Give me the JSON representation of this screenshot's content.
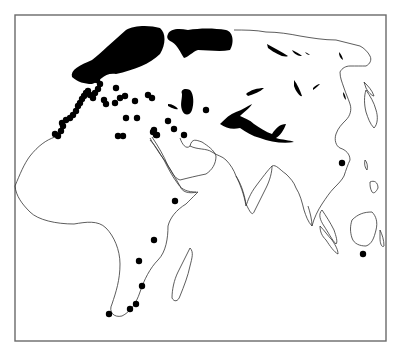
{
  "map": {
    "type": "distribution-map",
    "extent": "Africa, Europe and Asia",
    "colors": {
      "background": "#ffffff",
      "frame": "#6a6a6a",
      "coastline": "#333333",
      "range_fill": "#000000",
      "record_dot": "#000000"
    },
    "frame": {
      "x": 15,
      "y": 15,
      "width": 371,
      "height": 326
    },
    "dot_radius": 3.2,
    "range_regions": [
      {
        "name": "northern-europe-scandinavia",
        "path": "M72,77 C70,70 80,65 92,60 C102,52 112,42 126,30 C134,25 150,25 160,28 C166,33 166,44 160,54 C150,64 134,70 116,74 C104,72 100,82 92,84 C84,84 78,82 72,77 Z"
      },
      {
        "name": "northern-russia",
        "path": "M168,34 C170,29 178,28 188,30 C200,28 214,28 226,30 C234,32 234,44 230,50 C220,52 208,50 198,50 C192,52 190,56 184,58 C180,52 178,46 172,42 C168,40 166,38 168,34 Z"
      },
      {
        "name": "caspian-region",
        "path": "M182,94 C180,89 186,88 190,90 C194,94 194,104 192,110 C190,116 184,116 182,110 C180,104 182,100 182,94 Z"
      },
      {
        "name": "caucasus-streak",
        "path": "M168,104 C172,104 176,106 178,109 C176,110 172,108 168,106 Z"
      },
      {
        "name": "central-asia-tibet",
        "path": "M220,124 C226,118 230,114 236,112 C242,110 248,106 252,104 C250,108 244,112 240,116 C244,118 250,120 254,124 C260,128 266,132 272,134 C276,128 280,124 286,124 C284,130 280,136 276,138 C282,140 290,140 294,142 C284,144 270,142 260,138 C252,136 246,132 240,128 C232,130 226,128 220,124 Z"
      },
      {
        "name": "mongolia-patch",
        "path": "M246,94 C250,90 258,88 264,88 C260,92 254,94 248,96 Z"
      },
      {
        "name": "siberia-1",
        "path": "M267,44 C274,48 282,52 288,56 C284,58 276,54 268,48 Z"
      },
      {
        "name": "siberia-2",
        "path": "M292,50 C296,52 300,54 302,56 C298,56 294,54 292,50 Z"
      },
      {
        "name": "siberia-3",
        "path": "M305,52 C307,53 309,54 310,55 C308,55 306,54 305,52 Z"
      },
      {
        "name": "amur",
        "path": "M294,80 C297,84 300,90 302,96 C300,97 296,92 294,86 Z"
      },
      {
        "name": "far-east-1",
        "path": "M313,88 C315,86 318,84 320,84 C318,86 316,88 313,90 Z"
      },
      {
        "name": "kamchatka-patch",
        "path": "M339,52 C341,54 343,58 343,60 C340,58 339,56 339,52 Z"
      },
      {
        "name": "sakhalin-patch",
        "path": "M343,92 C345,94 346,98 346,100 C344,98 343,96 343,92 Z"
      }
    ],
    "record_dots": [
      {
        "x": 55,
        "y": 134
      },
      {
        "x": 58,
        "y": 136
      },
      {
        "x": 61,
        "y": 131
      },
      {
        "x": 63,
        "y": 126
      },
      {
        "x": 62,
        "y": 123
      },
      {
        "x": 66,
        "y": 120
      },
      {
        "x": 70,
        "y": 118
      },
      {
        "x": 73,
        "y": 115
      },
      {
        "x": 76,
        "y": 111
      },
      {
        "x": 78,
        "y": 106
      },
      {
        "x": 80,
        "y": 103
      },
      {
        "x": 82,
        "y": 99
      },
      {
        "x": 84,
        "y": 96
      },
      {
        "x": 86,
        "y": 93
      },
      {
        "x": 88,
        "y": 91
      },
      {
        "x": 90,
        "y": 95
      },
      {
        "x": 93,
        "y": 98
      },
      {
        "x": 95,
        "y": 93
      },
      {
        "x": 98,
        "y": 89
      },
      {
        "x": 100,
        "y": 84
      },
      {
        "x": 97,
        "y": 80
      },
      {
        "x": 104,
        "y": 100
      },
      {
        "x": 106,
        "y": 104
      },
      {
        "x": 115,
        "y": 103
      },
      {
        "x": 120,
        "y": 98
      },
      {
        "x": 125,
        "y": 96
      },
      {
        "x": 116,
        "y": 88
      },
      {
        "x": 135,
        "y": 101
      },
      {
        "x": 148,
        "y": 95
      },
      {
        "x": 152,
        "y": 98
      },
      {
        "x": 126,
        "y": 118
      },
      {
        "x": 137,
        "y": 118
      },
      {
        "x": 118,
        "y": 136
      },
      {
        "x": 123,
        "y": 136
      },
      {
        "x": 153,
        "y": 132
      },
      {
        "x": 156,
        "y": 135
      },
      {
        "x": 154,
        "y": 130
      },
      {
        "x": 157,
        "y": 135
      },
      {
        "x": 168,
        "y": 121
      },
      {
        "x": 174,
        "y": 129
      },
      {
        "x": 184,
        "y": 135
      },
      {
        "x": 206,
        "y": 110
      },
      {
        "x": 175,
        "y": 201
      },
      {
        "x": 154,
        "y": 240
      },
      {
        "x": 139,
        "y": 261
      },
      {
        "x": 142,
        "y": 286
      },
      {
        "x": 136,
        "y": 304
      },
      {
        "x": 130,
        "y": 309
      },
      {
        "x": 109,
        "y": 314
      },
      {
        "x": 342,
        "y": 163
      },
      {
        "x": 363,
        "y": 254
      }
    ],
    "coastlines": {
      "africa": "M55,137 C46,140 38,146 30,154 C24,162 20,172 16,186 C18,196 24,204 32,212 C40,222 58,226 76,226 C88,224 100,222 108,230 C116,236 122,250 122,262 C124,280 120,292 116,302 C110,310 112,318 120,316 C128,312 136,304 142,292 C146,278 150,268 160,260 C166,252 168,240 168,228 C170,220 176,212 186,206 C192,200 196,194 196,192 C186,194 180,192 178,186 C172,176 166,164 160,154 C156,146 150,140 148,134"
    }
  }
}
